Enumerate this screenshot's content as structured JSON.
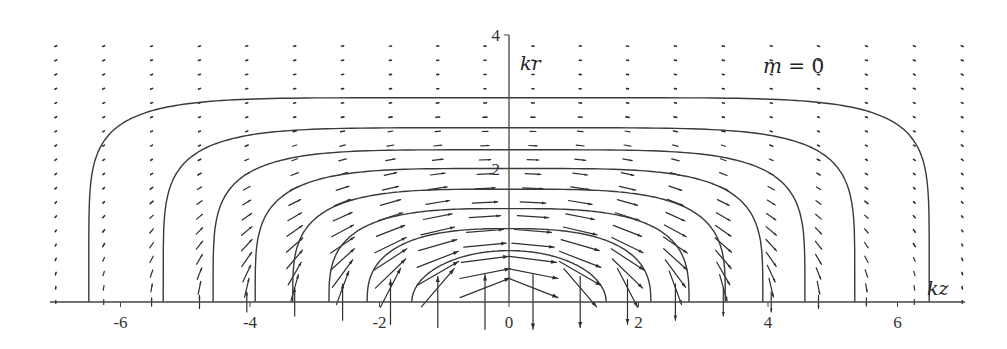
{
  "chart_data": {
    "type": "vector_field_with_contours",
    "title": "",
    "annotation": "m = 0",
    "annotation_parts": {
      "var": "m",
      "eq": " = 0"
    },
    "xlabel": "kz",
    "ylabel": "kr",
    "xlim": [
      -7.0,
      7.0
    ],
    "ylim": [
      0,
      4
    ],
    "x_ticks": [
      -6,
      -4,
      -2,
      0,
      2,
      4,
      6
    ],
    "x_tick_labels": [
      "-6",
      "-4",
      "-2",
      "0",
      "2",
      "4",
      "6"
    ],
    "y_ticks": [
      2,
      4
    ],
    "y_tick_labels": [
      "2",
      "4"
    ],
    "grid": false,
    "legend": null,
    "contours": [
      {
        "half_width": 6.49,
        "height": 3.06
      },
      {
        "half_width": 5.34,
        "height": 2.61
      },
      {
        "half_width": 4.57,
        "height": 2.28
      },
      {
        "half_width": 3.92,
        "height": 2.0
      },
      {
        "half_width": 3.34,
        "height": 1.69
      },
      {
        "half_width": 2.78,
        "height": 1.4
      },
      {
        "half_width": 2.19,
        "height": 1.1
      },
      {
        "half_width": 1.5,
        "height": 0.77
      }
    ],
    "vector_field": {
      "columns_kz": [
        -7.0,
        -6.26,
        -5.52,
        -4.78,
        -4.05,
        -3.31,
        -2.57,
        -1.83,
        -1.1,
        -0.37,
        0.37,
        1.1,
        1.83,
        2.57,
        3.31,
        4.05,
        4.78,
        5.52,
        6.26,
        7.0
      ],
      "rows_kr_count": 19,
      "row_spacing_kr": 0.213,
      "direction": "tangent to contours, pointing +kz (left side tilted down, right side tilted up)",
      "max_arrow_length_kz": 0.85
    }
  },
  "colors": {
    "line": "#3a3a3a",
    "arrow": "#2e2e2e",
    "axis": "#444444",
    "background": "#ffffff"
  }
}
